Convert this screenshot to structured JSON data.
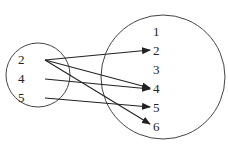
{
  "diagram": {
    "type": "mapping",
    "domain": {
      "label": "domain",
      "elements": [
        "2",
        "4",
        "5"
      ]
    },
    "codomain": {
      "label": "codomain",
      "elements": [
        "1",
        "2",
        "3",
        "4",
        "5",
        "6"
      ]
    },
    "mappings": [
      {
        "from": "2",
        "to": "2"
      },
      {
        "from": "2",
        "to": "4"
      },
      {
        "from": "2",
        "to": "6"
      },
      {
        "from": "4",
        "to": "4"
      },
      {
        "from": "5",
        "to": "5"
      }
    ],
    "colors": {
      "stroke": "#333333",
      "text": "#222222"
    }
  }
}
